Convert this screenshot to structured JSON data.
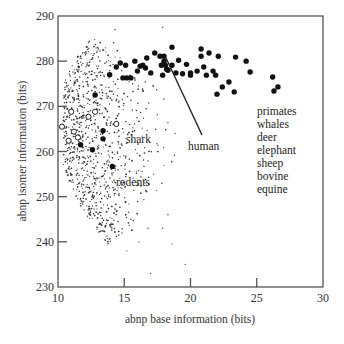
{
  "chart_data": {
    "type": "scatter",
    "title": "",
    "xlabel": "abnp base information (bits)",
    "ylabel": "abnp isomer information (bits)",
    "xlim": [
      10,
      30
    ],
    "ylim": [
      230,
      290
    ],
    "xticks": [
      10,
      15,
      20,
      25,
      30
    ],
    "yticks": [
      230,
      240,
      250,
      260,
      270,
      280,
      290
    ],
    "grid": false,
    "legend": null,
    "series": [
      {
        "name": "mammals (primates, whales, deer, elephant, sheep, bovine, equine)",
        "marker": "filled-circle-large",
        "points": [
          [
            16.7,
            280.7
          ],
          [
            17.3,
            281.8
          ],
          [
            17.7,
            281.1
          ],
          [
            18.0,
            281.1
          ],
          [
            18.1,
            279.1
          ],
          [
            14.4,
            278.7
          ],
          [
            14.7,
            279.6
          ],
          [
            15.1,
            279.1
          ],
          [
            15.8,
            280.0
          ],
          [
            16.2,
            278.9
          ],
          [
            16.4,
            279.1
          ],
          [
            17.0,
            277.4
          ],
          [
            18.2,
            278.2
          ],
          [
            17.8,
            279.1
          ],
          [
            16.6,
            278.5
          ],
          [
            13.9,
            277.0
          ],
          [
            14.9,
            276.3
          ],
          [
            15.2,
            276.3
          ],
          [
            15.5,
            276.3
          ],
          [
            16.0,
            277.8
          ],
          [
            12.8,
            272.5
          ],
          [
            18.6,
            283.1
          ],
          [
            20.8,
            282.7
          ],
          [
            20.8,
            281.1
          ],
          [
            21.4,
            281.8
          ],
          [
            22.1,
            281.1
          ],
          [
            23.4,
            280.9
          ],
          [
            24.2,
            280.0
          ],
          [
            19.1,
            280.2
          ],
          [
            18.6,
            279.1
          ],
          [
            18.0,
            280.0
          ],
          [
            19.7,
            279.3
          ],
          [
            21.0,
            278.7
          ],
          [
            20.5,
            277.8
          ],
          [
            21.7,
            277.8
          ],
          [
            21.2,
            276.9
          ],
          [
            20.0,
            277.4
          ],
          [
            20.0,
            276.9
          ],
          [
            19.4,
            277.2
          ],
          [
            18.9,
            277.4
          ],
          [
            18.3,
            278.0
          ],
          [
            17.9,
            276.9
          ],
          [
            21.9,
            276.9
          ],
          [
            24.5,
            277.6
          ],
          [
            22.4,
            274.3
          ],
          [
            22.9,
            275.4
          ],
          [
            23.3,
            273.2
          ],
          [
            26.2,
            276.5
          ],
          [
            26.6,
            274.3
          ],
          [
            26.3,
            273.4
          ],
          [
            22.0,
            272.7
          ],
          [
            13.4,
            264.6
          ],
          [
            13.4,
            262.8
          ],
          [
            11.7,
            261.5
          ],
          [
            12.6,
            260.4
          ],
          [
            14.1,
            256.7
          ]
        ]
      },
      {
        "name": "shark / fish (open circles)",
        "marker": "open-circle",
        "points": [
          [
            14.4,
            266.1
          ],
          [
            11.0,
            268.8
          ],
          [
            12.8,
            268.8
          ],
          [
            12.3,
            267.7
          ],
          [
            11.2,
            264.4
          ],
          [
            10.8,
            262.4
          ],
          [
            11.5,
            263.1
          ],
          [
            10.3,
            265.5
          ]
        ]
      },
      {
        "name": "other species (small dots)",
        "marker": "dot",
        "distribution": "dense crescent cloud from x≈10.5–19, y≈233–284, densest near x 10.5–13, y 255–275"
      }
    ],
    "annotations": [
      {
        "text": "shark",
        "x": 15.0,
        "y": 265.5
      },
      {
        "text": "rodents",
        "x": 14.4,
        "y": 254.5
      },
      {
        "text": "human",
        "x": 19.5,
        "y": 264.5,
        "pointer_to": [
          17.2,
          280.5
        ]
      },
      {
        "text": "primates",
        "x": 24.0,
        "y": 268.5
      },
      {
        "text": "whales",
        "x": 24.0,
        "y": 265.8
      },
      {
        "text": "deer",
        "x": 24.0,
        "y": 262.9
      },
      {
        "text": "elephant",
        "x": 24.0,
        "y": 260.1
      },
      {
        "text": "sheep",
        "x": 24.0,
        "y": 257.2
      },
      {
        "text": "bovine",
        "x": 24.0,
        "y": 254.4
      },
      {
        "text": "equine",
        "x": 24.0,
        "y": 251.6
      }
    ]
  },
  "labels": {
    "xlabel": "abnp base information (bits)",
    "ylabel": "abnp isomer information (bits)",
    "shark": "shark",
    "rodents": "rodents",
    "human": "human",
    "group_list": [
      "primates",
      "whales",
      "deer",
      "elephant",
      "sheep",
      "bovine",
      "equine"
    ]
  },
  "colors": {
    "axis": "#555555",
    "marker": "#111111",
    "text": "#222222",
    "background": "#ffffff"
  }
}
